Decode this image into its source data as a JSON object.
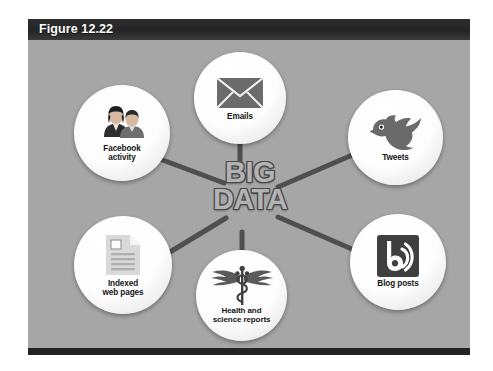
{
  "figure": {
    "title": "Figure 12.22",
    "header_color": "#2b2b2b",
    "background_color": "#a6a6a6"
  },
  "center": {
    "line1": "BIG",
    "line2": "DATA",
    "fill_color": "#b3b3b3",
    "outline_color": "#4a4a4a"
  },
  "nodes": [
    {
      "id": "facebook",
      "label": "Facebook\nactivity",
      "icon": "two-people-icon"
    },
    {
      "id": "emails",
      "label": "Emails",
      "icon": "envelope-icon"
    },
    {
      "id": "tweets",
      "label": "Tweets",
      "icon": "twitter-bird-icon"
    },
    {
      "id": "indexed",
      "label": "Indexed\nweb pages",
      "icon": "document-page-icon"
    },
    {
      "id": "health",
      "label": "Health and\nscience reports",
      "icon": "caduceus-icon"
    },
    {
      "id": "blog",
      "label": "Blog posts",
      "icon": "blog-rss-icon"
    }
  ],
  "connectors": {
    "color": "#4f4f4f",
    "links": [
      "facebook-center",
      "emails-center",
      "tweets-center",
      "indexed-center",
      "health-center",
      "blog-center"
    ]
  }
}
